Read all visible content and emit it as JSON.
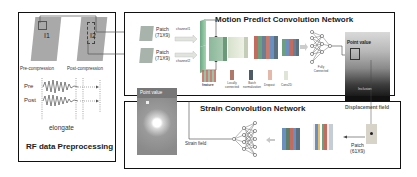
{
  "preprocessing": {
    "title": "RF data Preprocessing",
    "image1_label": "I1",
    "image2_label": "I2",
    "pre_caption": "Pre-compression",
    "post_caption": "Post-compression",
    "signal_pre": "Pre",
    "signal_post": "Post",
    "elongate": "elongate"
  },
  "motion_network": {
    "title": "Motion Predict Convolution Network",
    "patch1": {
      "label": "Patch",
      "size": "(71X9)",
      "channel": "channel1"
    },
    "patch2": {
      "label": "Patch",
      "size": "(71X9)",
      "channel": "channel2"
    },
    "feature_label": "feature",
    "legend": [
      {
        "label": "Locally connected",
        "color": "#c97a6a"
      },
      {
        "label": "Batch normalization",
        "color": "#6b7f8f"
      },
      {
        "label": "Dropout",
        "color": "#e8b8a8"
      },
      {
        "label": "Conv2D",
        "color": "#d8dfd0"
      }
    ],
    "fc_label": "Fully Connected",
    "point_value": "Point value",
    "inclusion": "Inclusion"
  },
  "displacement": {
    "label": "Displacement field"
  },
  "strain_network": {
    "title": "Strain Convolution Network",
    "point_value": "Point value",
    "strain_field": "Strain field",
    "patch": {
      "label": "Patch",
      "size": "(61X9)"
    }
  },
  "colors": {
    "border": "#111111",
    "patch_fill": "#a8a8a8",
    "green_slab": "#7fbf9a",
    "red_slab": "#c86060",
    "blue_slab": "#6a8fc0",
    "arrow": "#444444"
  }
}
